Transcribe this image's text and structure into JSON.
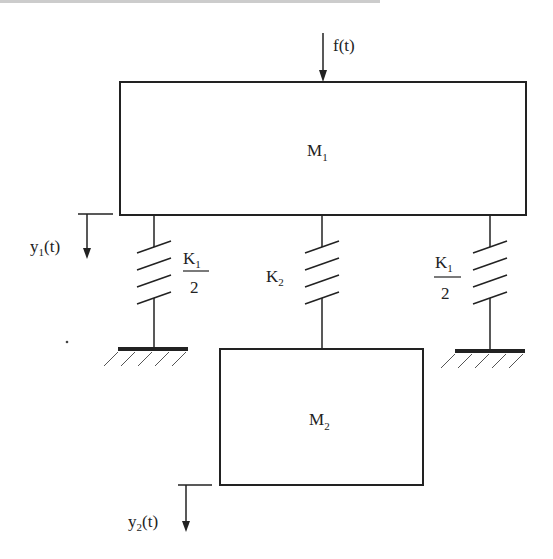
{
  "diagram": {
    "type": "two-mass spring system",
    "masses": [
      {
        "id": "M1",
        "label": "M",
        "sub": "1"
      },
      {
        "id": "M2",
        "label": "M",
        "sub": "2"
      }
    ],
    "springs": [
      {
        "id": "left",
        "label": "K",
        "sub": "1",
        "denominator": "2"
      },
      {
        "id": "middle",
        "label": "K",
        "sub": "2"
      },
      {
        "id": "right",
        "label": "K",
        "sub": "1",
        "denominator": "2"
      }
    ],
    "force": {
      "label": "f(t)"
    },
    "displacements": [
      {
        "id": "y1",
        "label_main": "y",
        "sub": "1",
        "suffix": "(t)"
      },
      {
        "id": "y2",
        "label_main": "y",
        "sub": "2",
        "suffix": "(t)"
      }
    ],
    "colors": {
      "stroke": "#222222",
      "background": "#ffffff"
    }
  }
}
